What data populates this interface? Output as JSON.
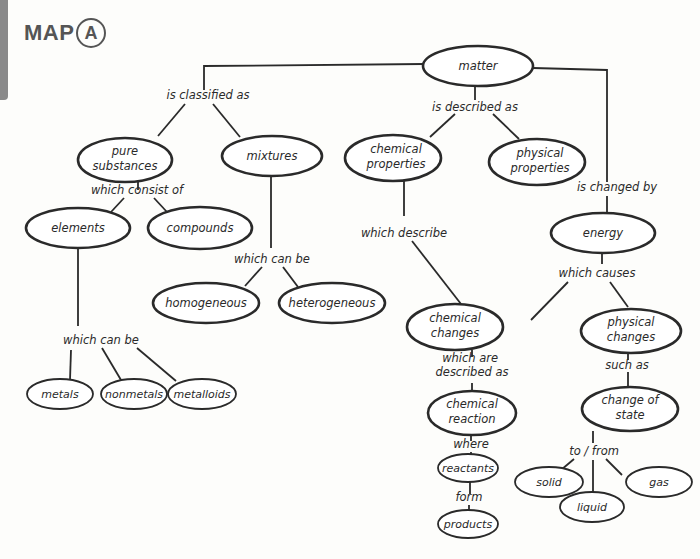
{
  "header": {
    "title": "MAP",
    "badge": "A"
  },
  "nodes": {
    "matter": "matter",
    "pure_substances": [
      "pure",
      "substances"
    ],
    "mixtures": "mixtures",
    "chemical_properties": [
      "chemical",
      "properties"
    ],
    "physical_properties": [
      "physical",
      "properties"
    ],
    "elements": "elements",
    "compounds": "compounds",
    "energy": "energy",
    "homogeneous": "homogeneous",
    "heterogeneous": "heterogeneous",
    "chemical_changes": [
      "chemical",
      "changes"
    ],
    "physical_changes": [
      "physical",
      "changes"
    ],
    "metals": "metals",
    "nonmetals": "nonmetals",
    "metalloids": "metalloids",
    "chemical_reaction": [
      "chemical",
      "reaction"
    ],
    "change_of_state": [
      "change of",
      "state"
    ],
    "reactants": "reactants",
    "products": "products",
    "solid": "solid",
    "liquid": "liquid",
    "gas": "gas"
  },
  "links": {
    "is_classified_as": "is classified as",
    "is_described_as": "is described as",
    "is_changed_by": "is changed by",
    "which_consist_of": "which consist of",
    "which_can_be_mixtures": "which can be",
    "which_can_be_elements": "which can be",
    "which_describe": "which describe",
    "which_causes": "which causes",
    "which_are_described_as": [
      "which are",
      "described as"
    ],
    "such_as": "such as",
    "where": "where",
    "form": "form",
    "to_from": "to / from"
  }
}
